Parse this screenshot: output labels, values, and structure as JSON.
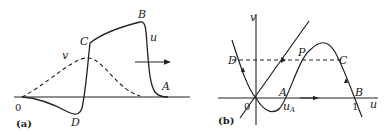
{
  "panel_a": {
    "tag": "(a)",
    "labels": {
      "origin": "0",
      "A": "A",
      "B": "B",
      "C": "C",
      "D": "D",
      "u": "u",
      "v": "v"
    }
  },
  "panel_b": {
    "tag": "(b)",
    "labels": {
      "origin": "0",
      "A": "A",
      "B": "B",
      "C": "C",
      "D": "D",
      "P": "P",
      "u": "u",
      "v": "v",
      "uA": "u",
      "uA_sub": "A",
      "one": "1"
    }
  }
}
